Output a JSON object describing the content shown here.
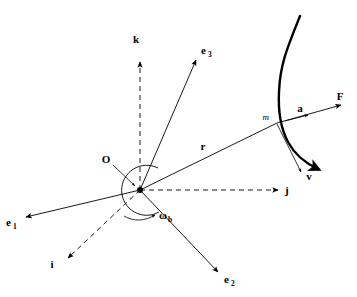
{
  "figure": {
    "background_color": "#ffffff",
    "stroke_color": "#000000",
    "width": 357,
    "height": 297
  },
  "labels": {
    "origin": "O",
    "particle_mass": "m",
    "inertial_i": "i",
    "inertial_j": "j",
    "inertial_k": "k",
    "body_e1": "e",
    "body_e1_sub": "1",
    "body_e2": "e",
    "body_e2_sub": "2",
    "body_e3": "e",
    "body_e3_sub": "3",
    "position_vector": "r",
    "force_vector": "F",
    "acceleration_vector": "a",
    "velocity_vector": "v",
    "angular_velocity": "ω",
    "angular_velocity_sub": "b"
  },
  "elements": [
    {
      "name": "inertial-axis-k",
      "label": "k",
      "style": "dashed",
      "direction": "up",
      "arrow": true
    },
    {
      "name": "inertial-axis-j",
      "label": "j",
      "style": "dashed",
      "direction": "right",
      "arrow": true
    },
    {
      "name": "inertial-axis-i",
      "label": "i",
      "style": "dashed",
      "direction": "down-left",
      "arrow": true
    },
    {
      "name": "body-axis-e1",
      "label": "e1",
      "style": "solid",
      "direction": "left",
      "arrow": true
    },
    {
      "name": "body-axis-e2",
      "label": "e2",
      "style": "solid",
      "direction": "down-right",
      "arrow": true
    },
    {
      "name": "body-axis-e3",
      "label": "e3",
      "style": "solid",
      "direction": "up-right",
      "arrow": true
    },
    {
      "name": "position-vector-r",
      "label": "r",
      "style": "solid",
      "direction": "up-right",
      "arrow": false
    },
    {
      "name": "force-vector-F",
      "label": "F",
      "style": "solid",
      "direction": "up-right",
      "arrow": true
    },
    {
      "name": "acceleration-vector-a",
      "label": "a",
      "style": "solid",
      "direction": "up-right",
      "arrow": true
    },
    {
      "name": "velocity-vector-v",
      "label": "v",
      "style": "solid",
      "direction": "down-right",
      "arrow": true
    },
    {
      "name": "angular-velocity-omega-b",
      "label": "ωb",
      "style": "solid",
      "direction": "curved",
      "arrow": true
    },
    {
      "name": "trajectory-curve",
      "label": "",
      "style": "thick",
      "direction": "s-curve",
      "arrow": true
    }
  ]
}
